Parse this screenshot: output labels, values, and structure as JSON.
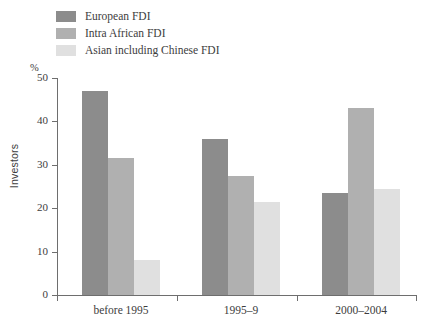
{
  "chart_data": {
    "type": "bar",
    "title": "",
    "subtitle": "",
    "xlabel": "",
    "ylabel": "Investors",
    "unit_label": "%",
    "categories": [
      "before 1995",
      "1995–9",
      "2000–2004"
    ],
    "series": [
      {
        "name": "European FDI",
        "color": "#8c8c8c",
        "values": [
          47,
          36,
          23.5
        ]
      },
      {
        "name": "Intra African FDI",
        "color": "#b0b0b0",
        "values": [
          31.5,
          27.5,
          43
        ]
      },
      {
        "name": "Asian including Chinese FDI",
        "color": "#e0e0e0",
        "values": [
          8,
          21.5,
          24.5
        ]
      }
    ],
    "ylim": [
      0,
      50
    ],
    "yticks": [
      0,
      10,
      20,
      30,
      40,
      50
    ],
    "ytick_labels": [
      "0",
      "10",
      "20",
      "30",
      "40",
      "50"
    ],
    "grid": false,
    "legend_position": "top-left",
    "axis_color": "#6e6e6e",
    "background": "#ffffff"
  },
  "legend": {
    "items": [
      {
        "label": "European FDI",
        "color": "#8c8c8c"
      },
      {
        "label": "Intra African FDI",
        "color": "#b0b0b0"
      },
      {
        "label": "Asian including Chinese FDI",
        "color": "#e0e0e0"
      }
    ]
  }
}
